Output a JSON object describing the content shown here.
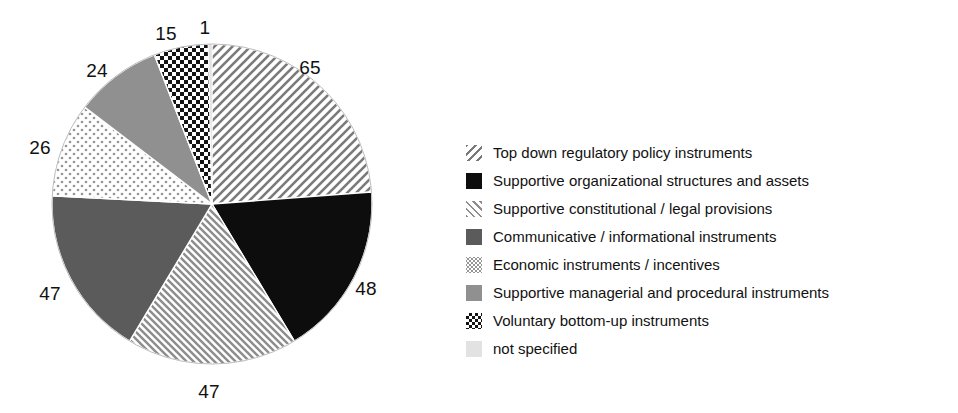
{
  "chart_data": {
    "type": "pie",
    "title": "",
    "xlabel": "",
    "ylabel": "",
    "total": 273,
    "start_angle_deg": 0,
    "direction": "clockwise",
    "categories": [
      "Top down regulatory policy instruments",
      "Supportive organizational structures and assets",
      "Supportive constitutional / legal provisions",
      "Communicative / informational instruments",
      "Economic instruments / incentives",
      "Supportive managerial and procedural instruments",
      "Voluntary bottom-up instruments",
      "not specified"
    ],
    "values": [
      65,
      48,
      47,
      47,
      26,
      24,
      15,
      1
    ],
    "labels": [
      "65",
      "48",
      "47",
      "47",
      "26",
      "24",
      "15",
      "1"
    ],
    "slices": [
      {
        "label": "65",
        "value": 65,
        "category": "Top down regulatory policy instruments",
        "pattern": "diagonal-hatch-sparse-backslash",
        "fill": "#ffffff",
        "ink": "#777777",
        "label_x": 310,
        "label_y": 68
      },
      {
        "label": "48",
        "value": 48,
        "category": "Supportive organizational structures and assets",
        "pattern": "solid",
        "fill": "#0d0d0d",
        "ink": "#0d0d0d",
        "label_x": 366,
        "label_y": 289
      },
      {
        "label": "47",
        "value": 47,
        "category": "Supportive constitutional / legal provisions",
        "pattern": "diagonal-hatch-dense-slash",
        "fill": "#ffffff",
        "ink": "#8a8a8a",
        "label_x": 209,
        "label_y": 392
      },
      {
        "label": "47",
        "value": 47,
        "category": "Communicative / informational instruments",
        "pattern": "solid",
        "fill": "#5b5b5b",
        "ink": "#5b5b5b",
        "label_x": 50,
        "label_y": 294
      },
      {
        "label": "26",
        "value": 26,
        "category": "Economic instruments / incentives",
        "pattern": "dots-light",
        "fill": "#ffffff",
        "ink": "#9a9a9a",
        "label_x": 40,
        "label_y": 148
      },
      {
        "label": "24",
        "value": 24,
        "category": "Supportive managerial and procedural instruments",
        "pattern": "solid",
        "fill": "#909090",
        "ink": "#909090",
        "label_x": 97,
        "label_y": 71
      },
      {
        "label": "15",
        "value": 15,
        "category": "Voluntary bottom-up instruments",
        "pattern": "checkerboard",
        "fill": "#ffffff",
        "ink": "#111111",
        "label_x": 166,
        "label_y": 34
      },
      {
        "label": "1",
        "value": 1,
        "category": "not specified",
        "pattern": "solid-very-light",
        "fill": "#e2e2e2",
        "ink": "#e2e2e2",
        "label_x": 205,
        "label_y": 28
      }
    ],
    "geometry": {
      "center_x": 212,
      "center_y": 204,
      "radius": 160
    },
    "legend_position": "right"
  },
  "legend": {
    "items": [
      {
        "label": "Top down regulatory policy instruments",
        "swatch": "diagonal-hatch-sparse-backslash"
      },
      {
        "label": "Supportive organizational structures and assets",
        "swatch": "solid-black"
      },
      {
        "label": "Supportive constitutional / legal provisions",
        "swatch": "diagonal-hatch-dense-slash"
      },
      {
        "label": "Communicative / informational instruments",
        "swatch": "solid-dark-gray"
      },
      {
        "label": "Economic instruments / incentives",
        "swatch": "dots-light"
      },
      {
        "label": "Supportive managerial and procedural instruments",
        "swatch": "solid-medium-gray"
      },
      {
        "label": "Voluntary bottom-up instruments",
        "swatch": "checkerboard"
      },
      {
        "label": "not specified",
        "swatch": "solid-very-light"
      }
    ]
  },
  "colors": {
    "background": "#ffffff",
    "text": "#111111",
    "black": "#0d0d0d",
    "dark_gray": "#5b5b5b",
    "medium_gray": "#909090",
    "light_gray": "#e2e2e2",
    "hatch_ink": "#777777"
  }
}
